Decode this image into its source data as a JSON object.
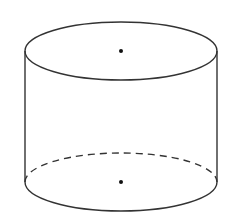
{
  "figure": {
    "type": "cylinder",
    "stroke_color": "#333333",
    "background": "#ffffff",
    "top_base": {
      "cx": 121,
      "cy": 51,
      "rx": 96,
      "ry": 29,
      "style": "solid",
      "center_point": {
        "x": 121,
        "y": 51
      }
    },
    "bottom_base": {
      "cx": 121,
      "cy": 182,
      "rx": 96,
      "ry": 29,
      "front_style": "solid",
      "back_style": "dashed",
      "center_point": {
        "x": 121,
        "y": 182
      }
    },
    "generators": [
      {
        "x": 25,
        "y1": 51,
        "y2": 182
      },
      {
        "x": 217,
        "y1": 51,
        "y2": 182
      }
    ]
  }
}
